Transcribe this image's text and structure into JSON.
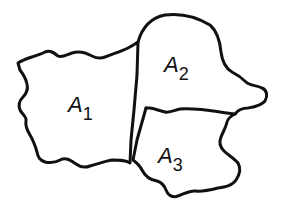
{
  "diagram": {
    "regions": [
      {
        "id": "A1",
        "letter": "A",
        "subscript": "1"
      },
      {
        "id": "A2",
        "letter": "A",
        "subscript": "2"
      },
      {
        "id": "A3",
        "letter": "A",
        "subscript": "3"
      }
    ],
    "stroke_color": "#111111",
    "background": "#ffffff"
  }
}
